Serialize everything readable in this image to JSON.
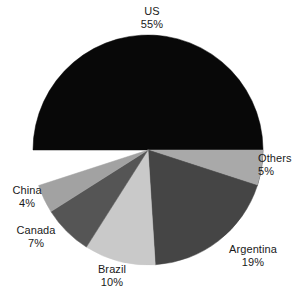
{
  "chart_data": {
    "type": "pie",
    "title": "",
    "subtitle": "",
    "xlabel": "",
    "ylabel": "",
    "legend_position": "none",
    "grid": false,
    "labels_show_percent": true,
    "categories": [
      "US",
      "Argentina",
      "Brazil",
      "Canada",
      "China",
      "Others"
    ],
    "values": [
      55,
      19,
      10,
      7,
      4,
      5
    ],
    "unit": "%",
    "slices": [
      {
        "name": "US",
        "value": 55,
        "value_text": "55%",
        "color": "#080808",
        "start_angle": 180,
        "end_angle": 378
      },
      {
        "name": "Others",
        "value": 5,
        "value_text": "5%",
        "color": "#a9a9a9",
        "start_angle": 0,
        "end_angle": 18
      },
      {
        "name": "Argentina",
        "value": 19,
        "value_text": "19%",
        "color": "#454545",
        "start_angle": 18,
        "end_angle": 86.4
      },
      {
        "name": "Brazil",
        "value": 10,
        "value_text": "10%",
        "color": "#c9c9c9",
        "start_angle": 86.4,
        "end_angle": 122.4
      },
      {
        "name": "Canada",
        "value": 7,
        "value_text": "7%",
        "color": "#555555",
        "start_angle": 122.4,
        "end_angle": 147.6
      },
      {
        "name": "China",
        "value": 4,
        "value_text": "4%",
        "color": "#a2a2a2",
        "start_angle": 147.6,
        "end_angle": 162
      }
    ],
    "geometry": {
      "center_x": 148,
      "center_y": 150,
      "radius": 115
    },
    "background_color": "#ffffff",
    "text_color": "#1a1a1a"
  },
  "labels": {
    "us": {
      "name": "US",
      "value": "55%"
    },
    "others": {
      "name": "Others",
      "value": "5%"
    },
    "argentina": {
      "name": "Argentina",
      "value": "19%"
    },
    "brazil": {
      "name": "Brazil",
      "value": "10%"
    },
    "canada": {
      "name": "Canada",
      "value": "7%"
    },
    "china": {
      "name": "China",
      "value": "4%"
    }
  }
}
